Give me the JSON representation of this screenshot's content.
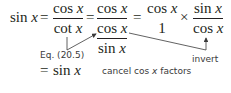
{
  "equation": {
    "lhs": "sin",
    "var": "x",
    "eq": "=",
    "frac1": {
      "num_fn": "cos",
      "den_fn": "cot"
    },
    "frac2": {
      "num_fn": "cos",
      "den_inner_num_fn": "cos",
      "den_inner_den_fn": "sin"
    },
    "frac3": {
      "num_fn": "cos",
      "den": "1"
    },
    "times": "×",
    "frac4": {
      "num_fn": "sin",
      "den_fn": "cos"
    },
    "result_eq": "=",
    "result_fn": "sin"
  },
  "annotations": {
    "eq_ref": "Eq. (20.5)",
    "invert": "invert",
    "cancel_prefix": "cancel cos ",
    "cancel_var": "x",
    "cancel_suffix": " factors"
  }
}
